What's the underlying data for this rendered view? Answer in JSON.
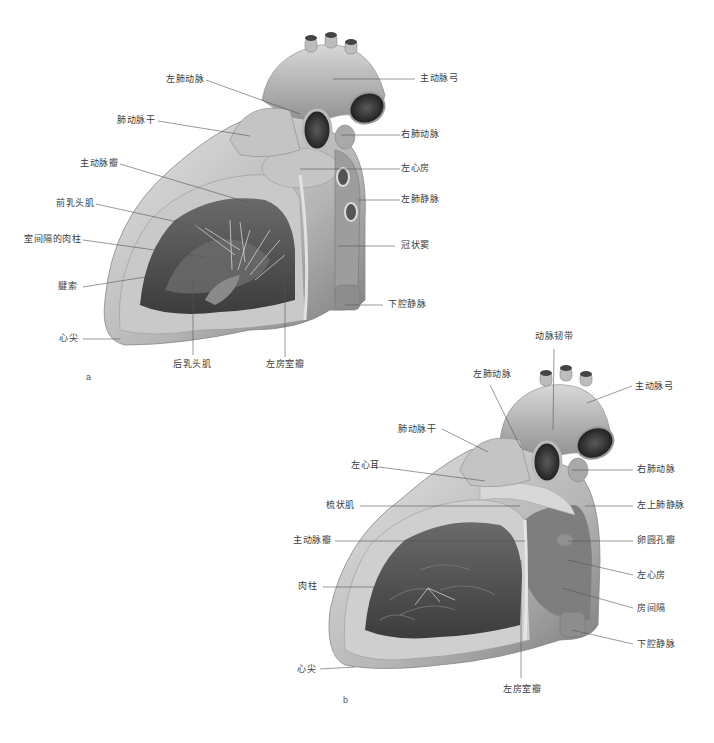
{
  "figure": {
    "panel_a": {
      "letter": "a",
      "labels": [
        {
          "id": "aortic-arch",
          "text": "主动脉弓"
        },
        {
          "id": "left-pulmonary-artery",
          "text": "左肺动脉"
        },
        {
          "id": "pulmonary-trunk",
          "text": "肺动脉干"
        },
        {
          "id": "right-pulmonary-artery",
          "text": "右肺动脉"
        },
        {
          "id": "aortic-valve",
          "text": "主动脉瓣"
        },
        {
          "id": "left-atrium",
          "text": "左心房"
        },
        {
          "id": "anterior-papillary-muscle",
          "text": "前乳头肌"
        },
        {
          "id": "left-pulmonary-veins",
          "text": "左肺静脉"
        },
        {
          "id": "septal-trabeculae",
          "text": "室间隔的肉柱"
        },
        {
          "id": "coronary-sinus",
          "text": "冠状窦"
        },
        {
          "id": "chordae-tendineae",
          "text": "腱索"
        },
        {
          "id": "inferior-vena-cava",
          "text": "下腔静脉"
        },
        {
          "id": "apex",
          "text": "心尖"
        },
        {
          "id": "posterior-papillary-muscle",
          "text": "后乳头肌"
        },
        {
          "id": "mitral-valve",
          "text": "左房室瓣"
        }
      ]
    },
    "panel_b": {
      "letter": "b",
      "labels": [
        {
          "id": "ligamentum-arteriosum",
          "text": "动脉韧带"
        },
        {
          "id": "left-pulmonary-artery",
          "text": "左肺动脉"
        },
        {
          "id": "aortic-arch",
          "text": "主动脉弓"
        },
        {
          "id": "pulmonary-trunk",
          "text": "肺动脉干"
        },
        {
          "id": "right-pulmonary-artery",
          "text": "右肺动脉"
        },
        {
          "id": "left-auricle",
          "text": "左心耳"
        },
        {
          "id": "pectinate-muscles",
          "text": "梳状肌"
        },
        {
          "id": "left-superior-pulmonary-vein",
          "text": "左上肺静脉"
        },
        {
          "id": "aortic-valve",
          "text": "主动脉瓣"
        },
        {
          "id": "foramen-ovale-valve",
          "text": "卵圆孔瓣"
        },
        {
          "id": "left-atrium",
          "text": "左心房"
        },
        {
          "id": "trabeculae-carneae",
          "text": "肉柱"
        },
        {
          "id": "interatrial-septum",
          "text": "房间隔"
        },
        {
          "id": "inferior-vena-cava",
          "text": "下腔静脉"
        },
        {
          "id": "apex",
          "text": "心尖"
        },
        {
          "id": "mitral-valve",
          "text": "左房室瓣"
        }
      ]
    },
    "colors": {
      "label_text": "#3a3a3a",
      "leader_line": "#555555",
      "tissue_light": "#d4d4d4",
      "tissue_mid": "#a8a8a8",
      "tissue_dark": "#4a4a4a"
    }
  }
}
